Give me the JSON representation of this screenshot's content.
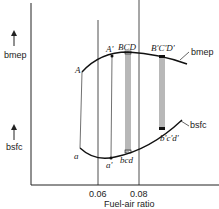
{
  "diagram": {
    "y_axis_labels": {
      "upper": "bmep",
      "lower": "bsfc"
    },
    "x_axis": {
      "title": "Fuel-air ratio",
      "ticks": [
        "0.06",
        "0.08"
      ]
    },
    "curves": {
      "bmep": {
        "label": "bmep",
        "points": [
          "A",
          "A'",
          "BCD",
          "B'C'D'"
        ]
      },
      "bsfc": {
        "label": "bsfc",
        "points": [
          "a",
          "a'",
          "bcd",
          "b'c'd'"
        ]
      }
    },
    "colors": {
      "line": "#222222",
      "background": "#ffffff"
    }
  }
}
